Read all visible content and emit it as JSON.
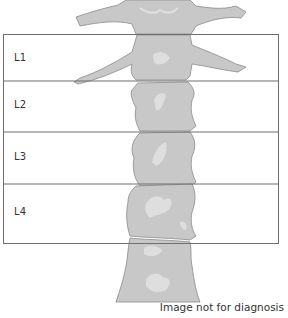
{
  "figure": {
    "type": "lumbar-spine-dxa-scan",
    "colors": {
      "bone_outline": "#8a8a8a",
      "bone_fill": "#c8c8c8",
      "bone_dense_fill": "#bdbdbd",
      "bone_highlight": "#dedede",
      "box_line": "#6e6e6e",
      "background": "#ffffff"
    },
    "regions": [
      {
        "label": "L1"
      },
      {
        "label": "L2"
      },
      {
        "label": "L3"
      },
      {
        "label": "L4"
      }
    ],
    "footer": "Image not for diagnosis"
  }
}
